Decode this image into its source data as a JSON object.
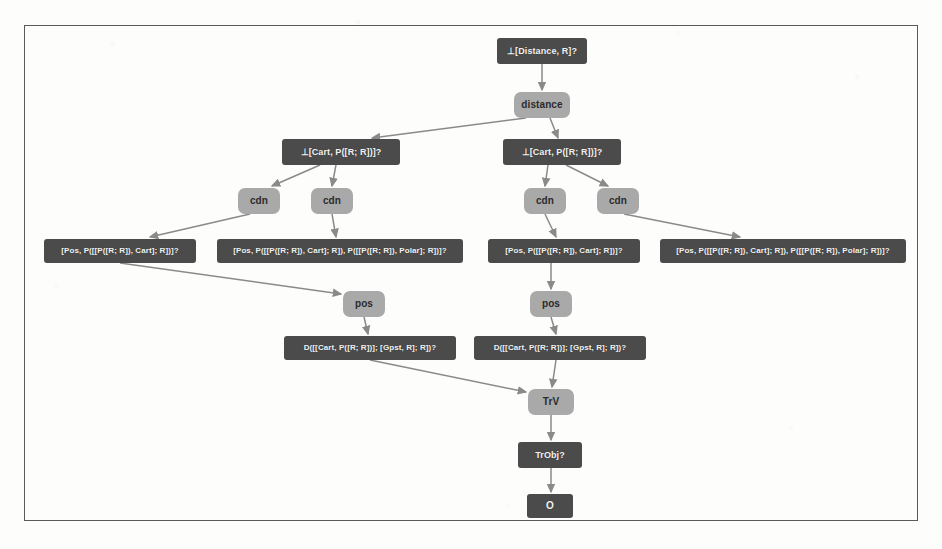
{
  "diagram": {
    "title_visible": false,
    "frame": {
      "border_color": "#5a5a5a"
    },
    "colors": {
      "dark_node": "#4b4b4b",
      "light_node": "#a9a9a9",
      "edge": "#8a8a8a",
      "page_background": "#fdfdfc",
      "dark_node_text": "#f2f2f2",
      "light_node_text": "#2b2b2b"
    },
    "nodes": [
      {
        "id": "n_root",
        "label": "⊥[Distance, R]?",
        "kind": "dark",
        "x": 497,
        "y": 38,
        "w": 90,
        "h": 26,
        "font": 9
      },
      {
        "id": "n_distance",
        "label": "distance",
        "kind": "light",
        "x": 514,
        "y": 92,
        "w": 56,
        "h": 26,
        "font": 10
      },
      {
        "id": "n_cartL",
        "label": "⊥[Cart, P([R; R])]?",
        "kind": "dark",
        "x": 282,
        "y": 139,
        "w": 118,
        "h": 26,
        "font": 9
      },
      {
        "id": "n_cartR",
        "label": "⊥[Cart, P([R; R])]?",
        "kind": "dark",
        "x": 503,
        "y": 139,
        "w": 118,
        "h": 26,
        "font": 9
      },
      {
        "id": "n_cdn1",
        "label": "cdn",
        "kind": "light",
        "x": 238,
        "y": 188,
        "w": 42,
        "h": 26,
        "font": 10
      },
      {
        "id": "n_cdn2",
        "label": "cdn",
        "kind": "light",
        "x": 311,
        "y": 188,
        "w": 42,
        "h": 26,
        "font": 10
      },
      {
        "id": "n_cdn3",
        "label": "cdn",
        "kind": "light",
        "x": 524,
        "y": 188,
        "w": 42,
        "h": 26,
        "font": 10
      },
      {
        "id": "n_cdn4",
        "label": "cdn",
        "kind": "light",
        "x": 597,
        "y": 188,
        "w": 42,
        "h": 26,
        "font": 10
      },
      {
        "id": "n_posL1",
        "label": "[Pos, P([[P([R; R]), Cart]; R])]?",
        "kind": "dark",
        "x": 44,
        "y": 239,
        "w": 152,
        "h": 24,
        "font": 8
      },
      {
        "id": "n_posL2",
        "label": "[Pos, P([[P([R; R]), Cart]; R]), P([[P([R; R]), Polar]; R])]?",
        "kind": "dark",
        "x": 217,
        "y": 239,
        "w": 246,
        "h": 24,
        "font": 8
      },
      {
        "id": "n_posR1",
        "label": "[Pos, P([[P([R; R]), Cart]; R])]?",
        "kind": "dark",
        "x": 488,
        "y": 239,
        "w": 152,
        "h": 24,
        "font": 8
      },
      {
        "id": "n_posR2",
        "label": "[Pos, P([[P([R; R]), Cart]; R]), P([[P([R; R]), Polar]; R])]?",
        "kind": "dark",
        "x": 660,
        "y": 239,
        "w": 246,
        "h": 24,
        "font": 8
      },
      {
        "id": "n_posLsm",
        "label": "pos",
        "kind": "light",
        "x": 343,
        "y": 291,
        "w": 42,
        "h": 26,
        "font": 10
      },
      {
        "id": "n_posRsm",
        "label": "pos",
        "kind": "light",
        "x": 530,
        "y": 291,
        "w": 42,
        "h": 26,
        "font": 10
      },
      {
        "id": "n_dL",
        "label": "D([[Cart, P([R; R])]; [Gpst, R]; R])?",
        "kind": "dark",
        "x": 284,
        "y": 336,
        "w": 172,
        "h": 24,
        "font": 8
      },
      {
        "id": "n_dR",
        "label": "D([[Cart, P([R; R])]; [Gpst, R]; R])?",
        "kind": "dark",
        "x": 474,
        "y": 336,
        "w": 172,
        "h": 24,
        "font": 8
      },
      {
        "id": "n_trv",
        "label": "TrV",
        "kind": "light",
        "x": 528,
        "y": 389,
        "w": 46,
        "h": 26,
        "font": 10
      },
      {
        "id": "n_trobj",
        "label": "TrObj?",
        "kind": "dark",
        "x": 518,
        "y": 442,
        "w": 64,
        "h": 26,
        "font": 9
      },
      {
        "id": "n_o",
        "label": "O",
        "kind": "dark",
        "x": 527,
        "y": 494,
        "w": 46,
        "h": 24,
        "font": 10
      }
    ],
    "edges": [
      {
        "from": "n_root",
        "to": "n_distance",
        "x1": 542,
        "y1": 64,
        "x2": 542,
        "y2": 90
      },
      {
        "from": "n_distance",
        "to": "n_cartL",
        "x1": 526,
        "y1": 118,
        "x2": 372,
        "y2": 138
      },
      {
        "from": "n_distance",
        "to": "n_cartR",
        "x1": 550,
        "y1": 118,
        "x2": 558,
        "y2": 138
      },
      {
        "from": "n_cartL",
        "to": "n_cdn1",
        "x1": 320,
        "y1": 165,
        "x2": 272,
        "y2": 186
      },
      {
        "from": "n_cartL",
        "to": "n_cdn2",
        "x1": 336,
        "y1": 165,
        "x2": 332,
        "y2": 186
      },
      {
        "from": "n_cartR",
        "to": "n_cdn3",
        "x1": 548,
        "y1": 165,
        "x2": 545,
        "y2": 186
      },
      {
        "from": "n_cartR",
        "to": "n_cdn4",
        "x1": 566,
        "y1": 165,
        "x2": 608,
        "y2": 186
      },
      {
        "from": "n_cdn1",
        "to": "n_posL1",
        "x1": 250,
        "y1": 214,
        "x2": 150,
        "y2": 237
      },
      {
        "from": "n_cdn2",
        "to": "n_posL2",
        "x1": 332,
        "y1": 214,
        "x2": 336,
        "y2": 237
      },
      {
        "from": "n_cdn3",
        "to": "n_posR1",
        "x1": 545,
        "y1": 214,
        "x2": 556,
        "y2": 237
      },
      {
        "from": "n_cdn4",
        "to": "n_posR2",
        "x1": 624,
        "y1": 214,
        "x2": 740,
        "y2": 237
      },
      {
        "from": "n_posL1",
        "to": "n_posLsm",
        "x1": 120,
        "y1": 263,
        "x2": 341,
        "y2": 294
      },
      {
        "from": "n_posLsm",
        "to": "n_dL",
        "x1": 364,
        "y1": 317,
        "x2": 368,
        "y2": 334
      },
      {
        "from": "n_posR1",
        "to": "n_posRsm",
        "x1": 551,
        "y1": 263,
        "x2": 551,
        "y2": 289
      },
      {
        "from": "n_posRsm",
        "to": "n_dR",
        "x1": 551,
        "y1": 317,
        "x2": 556,
        "y2": 334
      },
      {
        "from": "n_dL",
        "to": "n_trv",
        "x1": 370,
        "y1": 360,
        "x2": 526,
        "y2": 392
      },
      {
        "from": "n_dR",
        "to": "n_trv",
        "x1": 556,
        "y1": 360,
        "x2": 552,
        "y2": 387
      },
      {
        "from": "n_trv",
        "to": "n_trobj",
        "x1": 551,
        "y1": 415,
        "x2": 551,
        "y2": 440
      },
      {
        "from": "n_trobj",
        "to": "n_o",
        "x1": 551,
        "y1": 468,
        "x2": 551,
        "y2": 492
      }
    ]
  }
}
